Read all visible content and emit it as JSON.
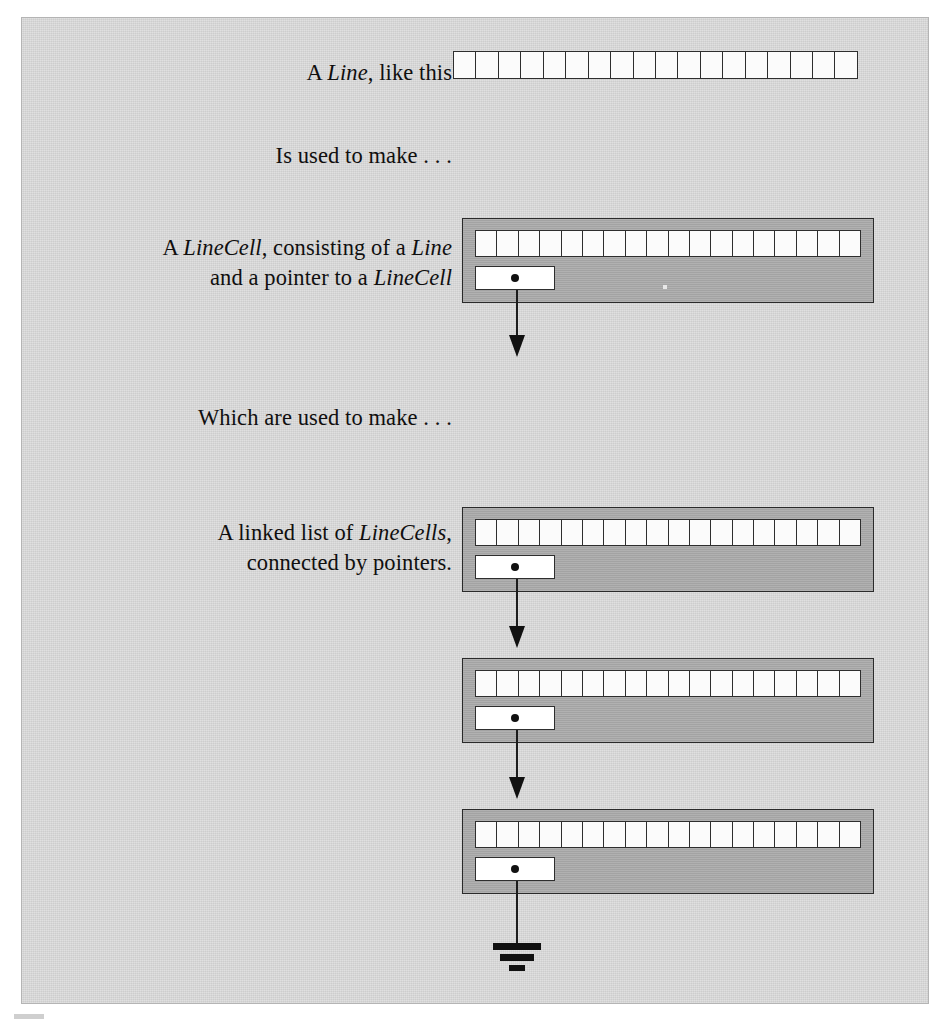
{
  "figure": {
    "background_color": "#d3d3d3",
    "record_color": "#a8a8a8",
    "ink_color": "#111111",
    "cell_color": "#ffffff",
    "line_cell_count": 18
  },
  "captions": [
    {
      "id": "caption-line",
      "segments": [
        {
          "text": "A ",
          "italic": false
        },
        {
          "text": "Line",
          "italic": true
        },
        {
          "text": ", like this",
          "italic": false
        }
      ],
      "plain": "A Line, like this"
    },
    {
      "id": "caption-is-used",
      "segments": [
        {
          "text": "Is used to make . . .",
          "italic": false
        }
      ],
      "plain": "Is used to make . . ."
    },
    {
      "id": "caption-linecell",
      "segments": [
        {
          "text": "A ",
          "italic": false
        },
        {
          "text": "LineCell",
          "italic": true
        },
        {
          "text": ", consisting of a ",
          "italic": false
        },
        {
          "text": "Line",
          "italic": true
        },
        {
          "text": "\nand a pointer to a ",
          "italic": false
        },
        {
          "text": "LineCell",
          "italic": true
        }
      ],
      "plain": "A LineCell, consisting of a Line and a pointer to a LineCell"
    },
    {
      "id": "caption-which-are-used",
      "segments": [
        {
          "text": "Which are used to make . . .",
          "italic": false
        }
      ],
      "plain": "Which are used to make . . ."
    },
    {
      "id": "caption-linked-list",
      "segments": [
        {
          "text": "A linked list of ",
          "italic": false
        },
        {
          "text": "LineCells",
          "italic": true
        },
        {
          "text": ",\nconnected by pointers.",
          "italic": false
        }
      ],
      "plain": "A linked list of LineCells, connected by pointers."
    }
  ],
  "diagram": {
    "standalone_line": {
      "label": "Line",
      "cells": 18
    },
    "linecell_example": {
      "label": "LineCell",
      "cells": 18,
      "pointer_label": "next"
    },
    "linked_list": {
      "node_count": 3,
      "nodes": [
        {
          "label": "LineCell",
          "cells": 18,
          "pointer_label": "next"
        },
        {
          "label": "LineCell",
          "cells": 18,
          "pointer_label": "next"
        },
        {
          "label": "LineCell",
          "cells": 18,
          "pointer_label": "next"
        }
      ],
      "terminator": "ground-null"
    }
  }
}
